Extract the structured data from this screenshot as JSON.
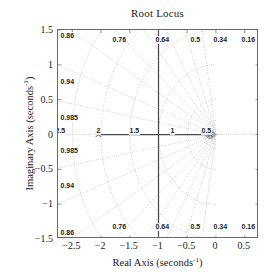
{
  "figure": {
    "title": "Root Locus",
    "xlabel_text": "Real Axis (seconds",
    "xlabel_exp": "-1",
    "xlabel_close": ")",
    "ylabel_text": "Imaginary Axis (seconds",
    "ylabel_exp": "-1",
    "ylabel_close": ")"
  },
  "axes": {
    "xticks": [
      "-2.5",
      "-2",
      "-1.5",
      "-1",
      "-0.5",
      "0",
      "0.5"
    ],
    "xtick_values": [
      -2.5,
      -2,
      -1.5,
      -1,
      -0.5,
      0,
      0.5
    ],
    "yticks": [
      "1.5",
      "1",
      "0.5",
      "0",
      "-0.5",
      "-1",
      "-1.5"
    ],
    "ytick_values": [
      1.5,
      1,
      0.5,
      0,
      -0.5,
      -1,
      -1.5
    ],
    "xlim": [
      -2.75,
      0.75
    ],
    "ylim": [
      -1.5,
      1.5
    ]
  },
  "chart_data": {
    "type": "line",
    "title": "Root Locus",
    "xlabel": "Real Axis (seconds^-1)",
    "ylabel": "Imaginary Axis (seconds^-1)",
    "xlim": [
      -2.75,
      0.75
    ],
    "ylim": [
      -1.5,
      1.5
    ],
    "grid": "sgrid",
    "legend": "none",
    "damping_ratios": [
      0.16,
      0.34,
      0.5,
      0.64,
      0.76,
      0.86,
      0.94,
      0.985,
      1.0
    ],
    "damping_labels_top": [
      "0.86",
      "0.76",
      "0.64",
      "0.5",
      "0.34",
      "0.16"
    ],
    "damping_labels_left": [
      "0.94",
      "0.985"
    ],
    "damping_labels_bottom": [
      "0.86",
      "0.76",
      "0.64",
      "0.5",
      "0.34",
      "0.16"
    ],
    "natural_frequencies": [
      0.5,
      1,
      1.5,
      2,
      2.5
    ],
    "natural_frequency_labels": [
      "2.5",
      "2",
      "1.5",
      "1",
      "0.5"
    ],
    "series": [
      {
        "name": "locus-real-branch",
        "style": "solid",
        "points": [
          [
            -2.05,
            0
          ],
          [
            -0.1,
            0
          ]
        ]
      },
      {
        "name": "locus-vertical-branch",
        "style": "solid",
        "points": [
          [
            -1.0,
            -1.5
          ],
          [
            -1.0,
            1.5
          ]
        ]
      }
    ],
    "markers": [
      {
        "name": "open-loop-pole",
        "symbol": "x",
        "x": -2.05,
        "y": 0
      },
      {
        "name": "open-loop-pole-cluster",
        "symbol": "x",
        "x": -0.1,
        "y": 0
      }
    ]
  },
  "grid_labels": {
    "top": [
      {
        "text": "0.86",
        "left": 2,
        "top": 2
      },
      {
        "text": "0.76",
        "left": 54,
        "top": 6
      },
      {
        "text": "0.64",
        "left": 97,
        "top": 6
      },
      {
        "text": "0.5",
        "left": 132,
        "top": 6
      },
      {
        "text": "0.34",
        "left": 155,
        "top": 6
      },
      {
        "text": "0.16",
        "left": 183,
        "top": 6
      }
    ],
    "left": [
      {
        "text": "0.94",
        "left": 2,
        "top": 48
      },
      {
        "text": "0.985",
        "left": 2,
        "top": 84
      }
    ],
    "left_lower": [
      {
        "text": "0.985",
        "left": 2,
        "top": 117
      },
      {
        "text": "0.94",
        "left": 2,
        "top": 152
      }
    ],
    "bottom": [
      {
        "text": "0.86",
        "left": 2,
        "top": 199
      },
      {
        "text": "0.76",
        "left": 54,
        "top": 193
      },
      {
        "text": "0.64",
        "left": 97,
        "top": 193
      },
      {
        "text": "0.5",
        "left": 132,
        "top": 193
      },
      {
        "text": "0.34",
        "left": 155,
        "top": 193
      },
      {
        "text": "0.16",
        "left": 183,
        "top": 193
      }
    ],
    "freq": [
      {
        "text": "2.5",
        "left": -3,
        "top": 97
      },
      {
        "text": "2",
        "left": 38,
        "top": 97
      },
      {
        "text": "1.5",
        "left": 71,
        "top": 97
      },
      {
        "text": "1",
        "left": 112,
        "top": 97
      },
      {
        "text": "0.5",
        "left": 143,
        "top": 97
      }
    ]
  }
}
